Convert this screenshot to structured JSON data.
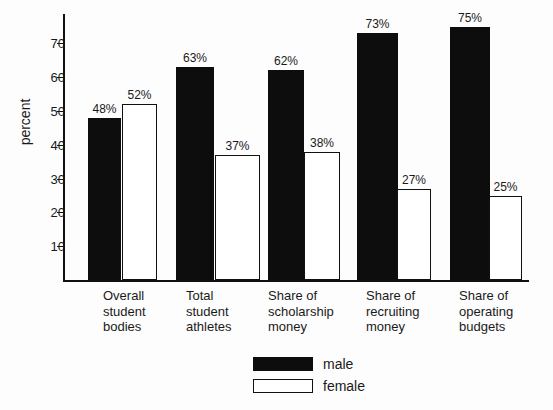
{
  "chart_data": {
    "type": "bar",
    "title": "",
    "xlabel": "",
    "ylabel": "percent",
    "ylim": [
      0,
      78
    ],
    "grid": false,
    "legend_position": "bottom-center",
    "categories": [
      "Overall\nstudent\nbodies",
      "Total\nstudent\nathletes",
      "Share of\nscholarship\nmoney",
      "Share of\nrecruiting\nmoney",
      "Share of\noperating\nbudgets"
    ],
    "y_ticks": [
      10,
      20,
      30,
      40,
      50,
      60,
      70
    ],
    "y_tick_labels": [
      "10",
      "20",
      "30",
      "40",
      "50",
      "60",
      "70"
    ],
    "series": [
      {
        "name": "male",
        "color": "#0d0d0d",
        "values": [
          48,
          63,
          62,
          73,
          75
        ],
        "labels": [
          "48%",
          "63%",
          "62%",
          "73%",
          "75%"
        ]
      },
      {
        "name": "female",
        "color": "#ffffff",
        "values": [
          52,
          37,
          38,
          27,
          25
        ],
        "labels": [
          "52%",
          "37%",
          "38%",
          "27%",
          "25%"
        ]
      }
    ]
  },
  "legend": {
    "items": [
      {
        "label": "male"
      },
      {
        "label": "female"
      }
    ]
  },
  "geometry": {
    "baseline_y": 280,
    "px_per_unit": 3.38,
    "groups": [
      {
        "male_x": 88,
        "male_w": 33,
        "female_x": 122,
        "female_w": 35,
        "label_x": 103
      },
      {
        "male_x": 176,
        "male_w": 38,
        "female_x": 215,
        "female_w": 45,
        "label_x": 186
      },
      {
        "male_x": 268,
        "male_w": 36,
        "female_x": 304,
        "female_w": 36,
        "label_x": 268
      },
      {
        "male_x": 357,
        "male_w": 41,
        "female_x": 397,
        "female_w": 34,
        "label_x": 366
      },
      {
        "male_x": 450,
        "male_w": 40,
        "female_x": 489,
        "female_w": 33,
        "label_x": 459
      }
    ]
  }
}
